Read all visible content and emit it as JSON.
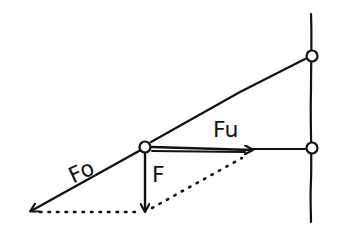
{
  "diagram": {
    "labels": {
      "fo": "Fo",
      "fu": "Fu",
      "f": "F"
    },
    "colors": {
      "ink": "#111111",
      "background": "#ffffff"
    }
  }
}
